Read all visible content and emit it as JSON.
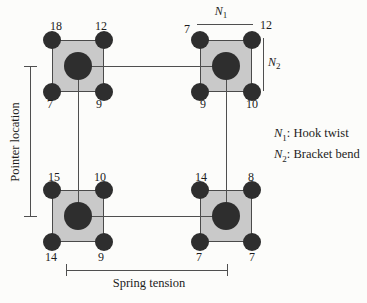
{
  "colors": {
    "background": "#fcfcfa",
    "square_fill": "#c9c9c9",
    "square_border": "#4a4a4a",
    "dot": "#2e2e2e",
    "line": "#4f4f4f",
    "text": "#1c1c1c"
  },
  "axes": {
    "left_label": "Pointer location",
    "bottom_label": "Spring tension"
  },
  "factors": {
    "n1": {
      "base": "N",
      "sub": "1"
    },
    "n2": {
      "base": "N",
      "sub": "2"
    }
  },
  "legend": {
    "n1_desc": ": Hook twist",
    "n2_desc": ": Bracket bend"
  },
  "squares": [
    {
      "id": "top-left",
      "corners": {
        "tl": "18",
        "tr": "12",
        "bl": "7",
        "br": "9"
      }
    },
    {
      "id": "top-right",
      "corners": {
        "tl": "7",
        "tr": "12",
        "bl": "9",
        "br": "10"
      }
    },
    {
      "id": "bottom-left",
      "corners": {
        "tl": "15",
        "tr": "10",
        "bl": "14",
        "br": "9"
      }
    },
    {
      "id": "bottom-right",
      "corners": {
        "tl": "14",
        "tr": "8",
        "bl": "7",
        "br": "7"
      }
    }
  ]
}
